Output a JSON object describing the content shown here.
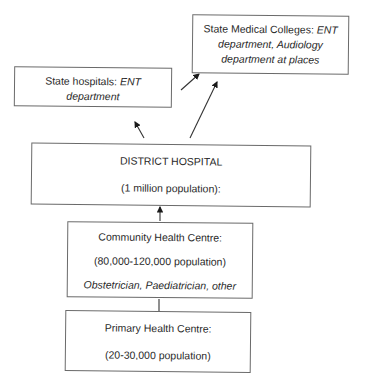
{
  "diagram": {
    "nodes": {
      "state_medical_colleges": {
        "label": "State Medical Colleges:",
        "detail": "ENT department, Audiology department at places"
      },
      "state_hospitals": {
        "label": "State hospitals:",
        "detail_line1": "ENT",
        "detail_line2": "department"
      },
      "district_hospital": {
        "label": "DISTRICT HOSPITAL",
        "population": "(1 million population):"
      },
      "community_health_centre": {
        "label": "Community Health Centre:",
        "population": "(80,000-120,000 population)",
        "staff": "Obstetrician, Paediatrician, other"
      },
      "primary_health_centre": {
        "label": "Primary Health Centre:",
        "population": "(20-30,000 population)"
      }
    },
    "edges": [
      {
        "from": "primary_health_centre",
        "to": "community_health_centre",
        "arrow": "none"
      },
      {
        "from": "community_health_centre",
        "to": "district_hospital",
        "arrow": "head"
      },
      {
        "from": "district_hospital",
        "to": "state_hospitals",
        "arrow": "head"
      },
      {
        "from": "district_hospital",
        "to": "state_medical_colleges",
        "arrow": "head"
      },
      {
        "from": "state_hospitals",
        "to": "state_medical_colleges",
        "arrow": "head"
      }
    ]
  }
}
